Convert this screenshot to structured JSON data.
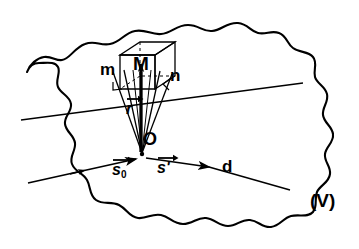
{
  "figure": {
    "type": "scientific-diagram",
    "background_color": "#ffffff",
    "stroke_color": "#000000",
    "width": 359,
    "height": 249
  },
  "labels": {
    "point_M": "M",
    "point_O": "O",
    "plane_trace_left": "m",
    "plane_trace_right": "n",
    "detector_direction": "d",
    "volume": "(V)"
  },
  "vectors": {
    "position": {
      "symbol": "r",
      "sub": "",
      "prime": "",
      "arrow": "vector-arrow"
    },
    "incident": {
      "symbol": "s",
      "sub": "0",
      "prime": "",
      "arrow": "vector-arrow"
    },
    "scattered": {
      "symbol": "s",
      "sub": "",
      "prime": "'",
      "arrow": "vector-arrow"
    }
  },
  "annotations": {
    "right_angle_mark_m": "right-angle-mark",
    "right_angle_mark_n": "right-angle-mark",
    "cube": "unit-cell-cube",
    "outline": "irregular-wavy-volume-boundary"
  }
}
